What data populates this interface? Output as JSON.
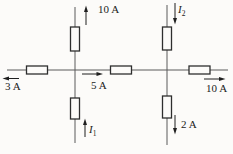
{
  "figure": {
    "type": "circuit-diagram",
    "colors": {
      "background": "#fcfbf9",
      "wire": "#5a5a5a",
      "component_stroke": "#2e2e2e",
      "arrow": "#1f1f1f",
      "text": "#1b1b1b"
    },
    "resistor_count": 7
  },
  "currents": {
    "top_left": {
      "label": "10 A",
      "direction": "up"
    },
    "top_right": {
      "symbol": "I",
      "subscript": "2",
      "direction": "down"
    },
    "left": {
      "label": "3 A",
      "direction": "left"
    },
    "middle": {
      "label": "5 A",
      "direction": "right"
    },
    "right": {
      "label": "10 A",
      "direction": "right"
    },
    "bottom_left": {
      "symbol": "I",
      "subscript": "1",
      "direction": "up"
    },
    "bottom_right": {
      "label": "2 A",
      "direction": "down"
    }
  }
}
